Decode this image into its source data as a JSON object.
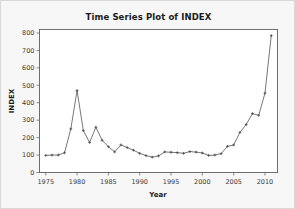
{
  "chart_data": {
    "type": "line",
    "title": "Time Series Plot of INDEX",
    "xlabel": "Year",
    "ylabel": "INDEX",
    "xlim": [
      1974,
      2012
    ],
    "ylim": [
      0,
      820
    ],
    "xticks": [
      1975,
      1980,
      1985,
      1990,
      1995,
      2000,
      2005,
      2010
    ],
    "yticks": [
      0,
      100,
      200,
      300,
      400,
      500,
      600,
      700,
      800
    ],
    "grid": false,
    "legend": false,
    "marker": "plus",
    "series": [
      {
        "name": "INDEX",
        "x": [
          1975,
          1976,
          1977,
          1978,
          1979,
          1980,
          1981,
          1982,
          1983,
          1984,
          1985,
          1986,
          1987,
          1988,
          1989,
          1990,
          1991,
          1992,
          1993,
          1994,
          1995,
          1996,
          1997,
          1998,
          1999,
          2000,
          2001,
          2002,
          2003,
          2004,
          2005,
          2006,
          2007,
          2008,
          2009,
          2010,
          2011
        ],
        "values": [
          98,
          100,
          100,
          113,
          250,
          470,
          240,
          172,
          260,
          185,
          148,
          118,
          158,
          143,
          128,
          110,
          97,
          88,
          95,
          118,
          116,
          114,
          110,
          120,
          117,
          112,
          98,
          100,
          108,
          150,
          158,
          230,
          275,
          338,
          328,
          455,
          785
        ]
      }
    ]
  }
}
